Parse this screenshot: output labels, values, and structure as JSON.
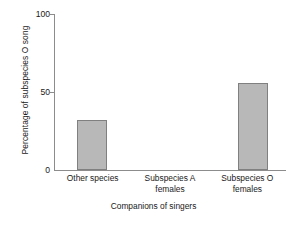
{
  "chart_data": {
    "type": "bar",
    "title": "",
    "xlabel": "Companions of singers",
    "ylabel": "Percentage of subspecies O song",
    "categories": [
      "Other species",
      "Subspecies A females",
      "Subspecies O females"
    ],
    "category_lines": [
      [
        "Other species",
        ""
      ],
      [
        "Subspecies A",
        "females"
      ],
      [
        "Subspecies O",
        "females"
      ]
    ],
    "values": [
      32,
      0,
      56
    ],
    "ylim": [
      0,
      100
    ],
    "yticks": [
      0,
      50,
      100
    ],
    "ytick_labels": [
      "0",
      "50",
      "100"
    ],
    "grid": false,
    "legend": "none",
    "colors": {
      "bar_fill": "#b8b8b8",
      "bar_border": "#808080",
      "axis": "#8c8c8c",
      "text": "#1a1a1a",
      "background": "#ffffff"
    }
  }
}
